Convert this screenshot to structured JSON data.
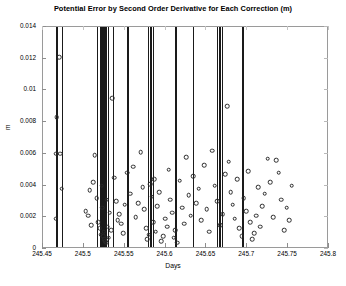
{
  "chart_data": {
    "type": "scatter",
    "title": "Potential Error by Second Order Derivative for Each Correction (m)",
    "xlabel": "Days",
    "ylabel": "m",
    "xlim": [
      245.45,
      245.8
    ],
    "ylim": [
      0,
      0.014
    ],
    "grid": false,
    "legend": null,
    "xticks": [
      245.45,
      245.5,
      245.55,
      245.6,
      245.65,
      245.7,
      245.75,
      245.8
    ],
    "xticklabels": [
      "245.45",
      "245.5",
      "245.55",
      "245.6",
      "245.65",
      "245.7",
      "245.75",
      "245.8"
    ],
    "yticks": [
      0,
      0.002,
      0.004,
      0.006,
      0.008,
      0.01,
      0.012,
      0.014
    ],
    "yticklabels": [
      "0",
      "0.002",
      "0.004",
      "0.006",
      "0.008",
      "0.01",
      "0.012",
      "0.014"
    ],
    "marker": "o",
    "marker_color": "#2a2a2a",
    "vline_color": "#1a1a1a",
    "series": [
      {
        "name": "potential error",
        "x": [
          245.4655,
          245.4662,
          245.467,
          245.4695,
          245.4712,
          245.4731,
          245.5021,
          245.5056,
          245.5073,
          245.509,
          245.5112,
          245.5133,
          245.5155,
          245.5178,
          245.5193,
          245.5208,
          245.5219,
          245.5228,
          245.5236,
          245.5244,
          245.5252,
          245.5261,
          245.527,
          245.528,
          245.5292,
          245.5305,
          245.5318,
          245.5332,
          245.535,
          245.5371,
          245.5394,
          245.5412,
          245.5432,
          245.5455,
          245.5478,
          245.5502,
          245.5531,
          245.5568,
          245.5602,
          245.5632,
          245.5665,
          245.5698,
          245.5722,
          245.5741,
          245.576,
          245.5778,
          245.5795,
          245.5812,
          245.5828,
          245.5845,
          245.5862,
          245.588,
          245.59,
          245.5922,
          245.5948,
          245.5972,
          245.5996,
          245.6018,
          245.6038,
          245.6058,
          245.6078,
          245.6098,
          245.612,
          245.6145,
          245.6172,
          245.62,
          245.6228,
          245.6255,
          245.6282,
          245.631,
          245.634,
          245.6372,
          245.6405,
          245.6438,
          245.647,
          245.6502,
          245.6535,
          245.6568,
          245.6602,
          245.6635,
          245.6668,
          245.67,
          245.6728,
          245.6752,
          245.6775,
          245.6798,
          245.6822,
          245.6848,
          245.6875,
          245.6902,
          245.693,
          245.6958,
          245.6985,
          245.7012,
          245.7038,
          245.7062,
          245.7085,
          245.7108,
          245.7132,
          245.7158,
          245.7185,
          245.7215,
          245.7248,
          245.7282,
          245.7318,
          245.7352,
          245.7385,
          245.7418,
          245.745,
          245.7482,
          245.7512,
          245.7542
        ],
        "y": [
          0.0019,
          0.006,
          0.0083,
          0.0121,
          0.006,
          0.0038,
          0.0024,
          0.0021,
          0.0037,
          0.0015,
          0.0042,
          0.0059,
          0.0032,
          0.0017,
          0.0013,
          0.0009,
          0.004,
          0.0026,
          0.0008,
          0.0011,
          0.0006,
          0.0005,
          0.0004,
          0.0031,
          0.0014,
          0.0007,
          0.0023,
          0.0012,
          0.0095,
          0.0045,
          0.003,
          0.0018,
          0.0022,
          0.0016,
          0.001,
          0.0028,
          0.0048,
          0.0035,
          0.0052,
          0.002,
          0.0029,
          0.0061,
          0.0039,
          0.0025,
          0.0013,
          0.0006,
          0.0009,
          0.0041,
          0.0033,
          0.0017,
          0.0044,
          0.0011,
          0.0027,
          0.0036,
          0.0005,
          0.0008,
          0.0019,
          0.0014,
          0.005,
          0.0031,
          0.0023,
          0.0007,
          0.0012,
          0.0004,
          0.0043,
          0.0026,
          0.0016,
          0.0058,
          0.0034,
          0.0021,
          0.0046,
          0.0029,
          0.0038,
          0.0018,
          0.0053,
          0.0025,
          0.0011,
          0.0062,
          0.004,
          0.003,
          0.0015,
          0.0022,
          0.0047,
          0.009,
          0.0055,
          0.0036,
          0.0028,
          0.0019,
          0.0044,
          0.0013,
          0.0008,
          0.0032,
          0.0024,
          0.0049,
          0.0017,
          0.0006,
          0.001,
          0.0021,
          0.0039,
          0.0014,
          0.0027,
          0.0035,
          0.0057,
          0.0042,
          0.002,
          0.0056,
          0.0048,
          0.0031,
          0.0012,
          0.0026,
          0.0018,
          0.004
        ]
      }
    ],
    "vlines": [
      245.4658,
      245.4668,
      245.4738,
      245.5162,
      245.5196,
      245.5206,
      245.5214,
      245.5222,
      245.523,
      245.5238,
      245.5246,
      245.5256,
      245.5268,
      245.53,
      245.5352,
      245.5525,
      245.5545,
      245.579,
      245.5808,
      245.5826,
      245.5852,
      245.6112,
      245.6122,
      245.634,
      245.663,
      245.6648,
      245.666,
      245.6672,
      245.6688,
      245.693,
      245.6942
    ]
  }
}
